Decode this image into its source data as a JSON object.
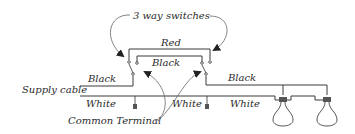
{
  "diagram": {
    "title_annotation": "3 way switches",
    "labels": {
      "red": "Red",
      "black_traveler": "Black",
      "black_supply": "Black",
      "black_load": "Black",
      "supply_cable": "Supply cable",
      "white_supply": "White",
      "white_mid": "White",
      "white_load": "White",
      "common_terminal": "Common Terminal"
    },
    "components": {
      "switches": [
        "3-way switch (left)",
        "3-way switch (right)"
      ],
      "bulbs": 2
    },
    "colors": {
      "wire": "#3a3a3a",
      "text": "#2a2a2a",
      "background": "#ffffff"
    }
  }
}
